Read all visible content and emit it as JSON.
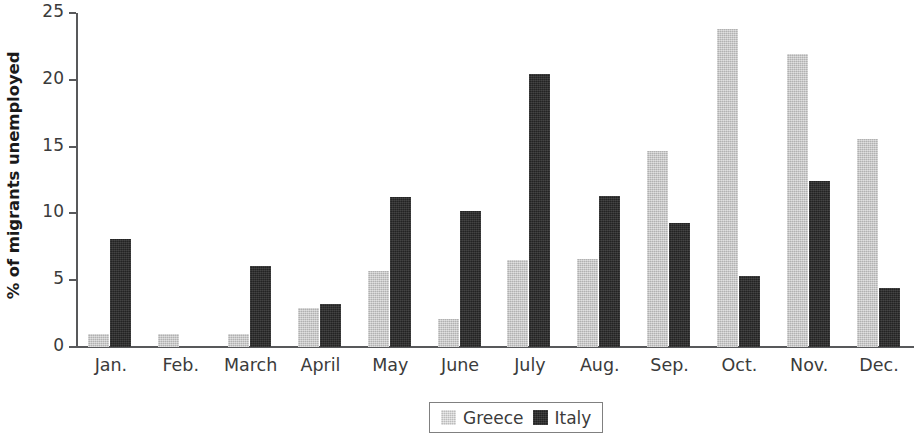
{
  "chart_data": {
    "type": "bar",
    "title": "",
    "subtitle": "",
    "xlabel": "",
    "ylabel": "% of migrants unemployed",
    "ylim": [
      0,
      25
    ],
    "yticks": [
      0,
      5,
      10,
      15,
      20,
      25
    ],
    "ytick_labels": [
      "0",
      "5",
      "10",
      "15",
      "20",
      "25"
    ],
    "grid": false,
    "legend_position": "bottom-center",
    "categories": [
      "Jan.",
      "Feb.",
      "March",
      "April",
      "May",
      "June",
      "July",
      "Aug.",
      "Sep.",
      "Oct.",
      "Nov.",
      "Dec."
    ],
    "series": [
      {
        "name": "Greece",
        "color": "#c6c6c6",
        "values": [
          1.0,
          1.0,
          1.0,
          2.9,
          5.7,
          2.1,
          6.5,
          6.6,
          14.7,
          23.8,
          21.9,
          15.6
        ]
      },
      {
        "name": "Italy",
        "color": "#2b2b2b",
        "values": [
          8.1,
          0.0,
          6.1,
          3.2,
          11.2,
          10.2,
          20.4,
          11.3,
          9.3,
          5.3,
          12.4,
          4.4
        ]
      }
    ],
    "annotations": []
  },
  "legend": {
    "entries": [
      {
        "label": "Greece",
        "swatch": "greece-swatch"
      },
      {
        "label": "Italy",
        "swatch": "italy-swatch"
      }
    ]
  },
  "colors": {
    "greece": "#c6c6c6",
    "italy": "#2b2b2b",
    "axis": "#58595b",
    "text": "#3b3b3b",
    "background": "#ffffff"
  }
}
